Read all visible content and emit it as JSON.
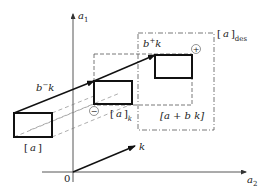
{
  "diagram": {
    "axes": {
      "vertical_label": "a",
      "vertical_sub": "1",
      "horizontal_label": "a",
      "horizontal_sub": "2",
      "origin_label": "0"
    },
    "boxes": {
      "a": {
        "label_open": "[",
        "label_var": "a",
        "label_close": "]"
      },
      "a_k": {
        "label_open": "[",
        "label_var": "a",
        "label_close": "]",
        "label_sub": "k"
      },
      "a_bk": {
        "label": "[a + b k]"
      },
      "a_des": {
        "label_open": "[",
        "label_var": "a",
        "label_close": "]",
        "label_sub": "des"
      }
    },
    "vectors": {
      "b_minus_k": {
        "base": "b",
        "sup": "−",
        "var": "k"
      },
      "b_plus_k": {
        "base": "b",
        "sup": "+",
        "var": "k"
      },
      "k": {
        "label": "k"
      }
    },
    "signs": {
      "minus": "−",
      "plus": "+"
    }
  }
}
